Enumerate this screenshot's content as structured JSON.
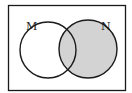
{
  "diagram": {
    "type": "venn",
    "universe": {
      "label": ""
    },
    "sets": [
      {
        "id": "M",
        "label": "M",
        "shaded": false
      },
      {
        "id": "N",
        "label": "N",
        "shaded": true
      }
    ],
    "shaded_region": "N",
    "colors": {
      "shade": "#d3d3d3",
      "stroke": "#1a1a1a",
      "background": "#ffffff"
    }
  }
}
